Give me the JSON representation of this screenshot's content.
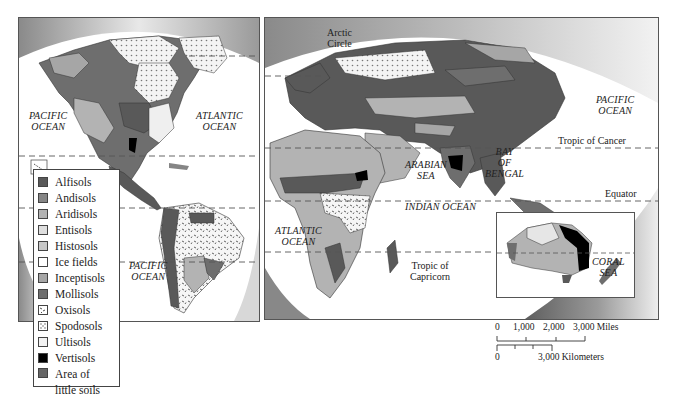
{
  "map": {
    "title": "World Soil Orders",
    "panels": {
      "americas": {
        "ocean_labels": [
          {
            "id": "pacific-north",
            "text": "PACIFIC\nOCEAN"
          },
          {
            "id": "atlantic-north",
            "text": "ATLANTIC\nOCEAN"
          },
          {
            "id": "pacific-south",
            "text": "PACIFIC\nOCEAN"
          }
        ]
      },
      "eastern": {
        "ocean_labels": [
          {
            "id": "pacific-east",
            "text": "PACIFIC\nOCEAN"
          },
          {
            "id": "arabian-sea",
            "text": "ARABIAN\nSEA"
          },
          {
            "id": "bay-of-bengal",
            "text": "BAY\nOF\nBENGAL"
          },
          {
            "id": "indian-ocean",
            "text": "INDIAN OCEAN"
          },
          {
            "id": "atlantic-south",
            "text": "ATLANTIC\nOCEAN"
          },
          {
            "id": "coral-sea",
            "text": "CORAL\nSEA"
          }
        ],
        "line_labels": {
          "arctic_circle": "Arctic\nCircle",
          "tropic_of_cancer": "Tropic of Cancer",
          "equator": "Equator",
          "tropic_of_capricorn": "Tropic of\nCapricorn"
        }
      }
    },
    "legend": {
      "items": [
        {
          "label": "Alfisols",
          "color": "#595959",
          "pattern": "solid"
        },
        {
          "label": "Andisols",
          "color": "#858585",
          "pattern": "solid"
        },
        {
          "label": "Aridisols",
          "color": "#b3b3b3",
          "pattern": "solid"
        },
        {
          "label": "Entisols",
          "color": "#dedede",
          "pattern": "solid"
        },
        {
          "label": "Histosols",
          "color": "#c8c8c8",
          "pattern": "solid"
        },
        {
          "label": "Ice fields",
          "color": "#ffffff",
          "pattern": "solid"
        },
        {
          "label": "Inceptisols",
          "color": "#a6a6a6",
          "pattern": "solid"
        },
        {
          "label": "Mollisols",
          "color": "#6e6e6e",
          "pattern": "solid"
        },
        {
          "label": "Oxisols",
          "color": "#ffffff",
          "pattern": "dashes"
        },
        {
          "label": "Spodosols",
          "color": "#ffffff",
          "pattern": "dots"
        },
        {
          "label": "Ultisols",
          "color": "#f2f2f2",
          "pattern": "solid"
        },
        {
          "label": "Vertisols",
          "color": "#000000",
          "pattern": "solid"
        },
        {
          "label": "Area of\nlittle soils",
          "color": "#666666",
          "pattern": "solid"
        }
      ]
    },
    "scale_bar": {
      "miles_ticks": [
        "0",
        "1,000",
        "2,000",
        "3,000 Miles"
      ],
      "km_labels": [
        "0",
        "3,000 Kilometers"
      ]
    }
  }
}
